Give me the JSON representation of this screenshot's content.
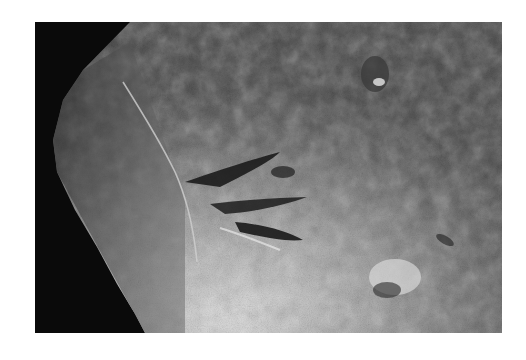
{
  "image": {
    "description": "Grayscale photograph of a weathered rock slab with a dark elongated trace feature near the center",
    "colors": {
      "background": "#ffffff",
      "shadow": "#0a0a0a",
      "rock_mid": "#6e6e6e",
      "rock_light": "#d8d8d8",
      "trace_dark": "#1a1a1a"
    }
  }
}
